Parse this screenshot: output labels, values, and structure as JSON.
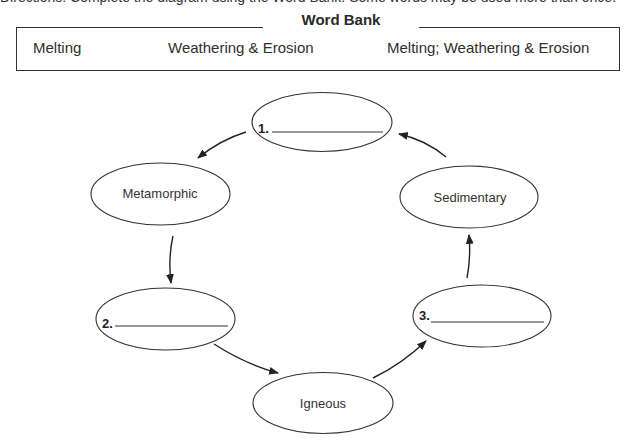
{
  "worksheet": {
    "directions_cropped": "Directions: Complete the diagram using the Word Bank. Some words may be used more than once."
  },
  "word_bank": {
    "title": "Word Bank",
    "words": [
      "Melting",
      "Weathering & Erosion",
      "Melting; Weathering & Erosion"
    ]
  },
  "diagram": {
    "type": "rock-cycle",
    "nodes": [
      {
        "id": "blank1",
        "number": "1.",
        "label": "",
        "kind": "blank"
      },
      {
        "id": "metamorphic",
        "label": "Metamorphic",
        "kind": "rock"
      },
      {
        "id": "blank2",
        "number": "2.",
        "label": "",
        "kind": "blank"
      },
      {
        "id": "igneous",
        "label": "Igneous",
        "kind": "rock"
      },
      {
        "id": "blank3",
        "number": "3.",
        "label": "",
        "kind": "blank"
      },
      {
        "id": "sedimentary",
        "label": "Sedimentary",
        "kind": "rock"
      }
    ],
    "edges": [
      {
        "from": "blank1",
        "to": "metamorphic"
      },
      {
        "from": "metamorphic",
        "to": "blank2"
      },
      {
        "from": "blank2",
        "to": "igneous"
      },
      {
        "from": "igneous",
        "to": "blank3"
      },
      {
        "from": "blank3",
        "to": "sedimentary"
      },
      {
        "from": "sedimentary",
        "to": "blank1"
      }
    ]
  }
}
